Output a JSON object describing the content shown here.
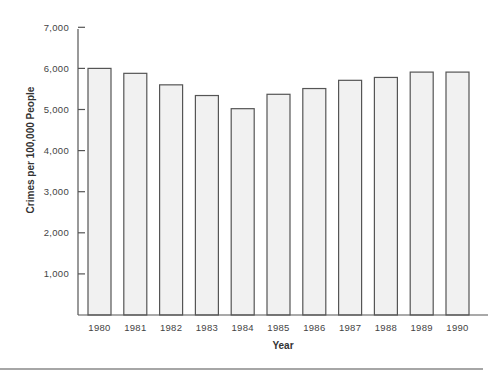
{
  "chart_data": {
    "type": "bar",
    "title": "",
    "xlabel": "Year",
    "ylabel": "Crimes per 100,000 People",
    "categories": [
      "1980",
      "1981",
      "1982",
      "1983",
      "1984",
      "1985",
      "1986",
      "1987",
      "1988",
      "1989",
      "1990"
    ],
    "values": [
      6000,
      5880,
      5600,
      5340,
      5020,
      5370,
      5510,
      5710,
      5780,
      5910,
      5910
    ],
    "ylim": [
      0,
      7000
    ],
    "yticks": [
      1000,
      2000,
      3000,
      4000,
      5000,
      6000,
      7000
    ],
    "ytick_labels": [
      "1,000",
      "2,000",
      "3,000",
      "4,000",
      "5,000",
      "6,000",
      "7,000"
    ],
    "grid": false,
    "legend": null,
    "colors": {
      "bar_fill": "#f1f1f1",
      "bar_stroke": "#555555"
    }
  }
}
